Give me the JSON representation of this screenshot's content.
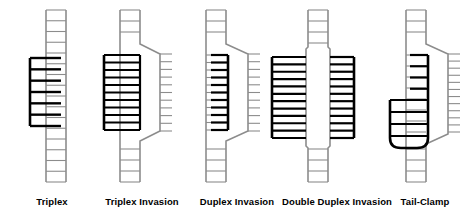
{
  "figure": {
    "title": "",
    "background_color": "#ffffff",
    "duplex_color": "#8c8c8c",
    "invader_color": "#000000",
    "width": 463,
    "height": 217
  },
  "panels": [
    {
      "id": "triplex",
      "label": "Triplex",
      "label_x": 52,
      "center_x": 52,
      "description": "A third strand binds in the major groove of an intact duplex",
      "duplex": {
        "x": 46,
        "top": 10,
        "bottom": 182,
        "width": 20,
        "rungs": 16
      },
      "invader": {
        "type": "single-strand",
        "side": "left",
        "x": 30,
        "top": 58,
        "bottom": 126,
        "rungs": 7
      }
    },
    {
      "id": "triplex-invasion",
      "label": "Triplex Invasion",
      "label_x": 142,
      "center_x": 137,
      "description": "Two strands form a triplex with one duplex strand while the other strand is displaced",
      "duplex": {
        "x": 120,
        "top": 10,
        "bottom": 182,
        "width": 20,
        "rungs": 16
      },
      "invader": {
        "type": "bis-strand",
        "side": "left",
        "x": 104,
        "top": 55,
        "bottom": 130,
        "rungs": 10
      },
      "displaced": {
        "side": "right",
        "bulge_x": 160,
        "top": 48,
        "bottom": 137,
        "ticks": 10
      }
    },
    {
      "id": "duplex-invasion",
      "label": "Duplex Invasion",
      "label_x": 237,
      "center_x": 225,
      "description": "A single invading strand pairs with one duplex strand, displacing the other",
      "duplex": {
        "x": 206,
        "top": 10,
        "bottom": 182,
        "width": 20,
        "rungs": 16
      },
      "invader": {
        "type": "single-strand",
        "side": "right-inner",
        "x": 228,
        "top": 55,
        "bottom": 130,
        "rungs": 10
      },
      "displaced": {
        "side": "right",
        "bulge_x": 248,
        "top": 48,
        "bottom": 137,
        "ticks": 10
      }
    },
    {
      "id": "double-duplex-invasion",
      "label": "Double Duplex Invasion",
      "label_x": 337,
      "center_x": 318,
      "description": "Two invading strands each pair with one of the separated duplex strands",
      "duplex": {
        "x": 308,
        "top": 10,
        "bottom": 182,
        "width": 20,
        "rungs": 16
      },
      "invader_left": {
        "type": "single-strand",
        "side": "left",
        "x": 272,
        "top": 57,
        "bottom": 138,
        "rungs": 11
      },
      "invader_right": {
        "type": "single-strand",
        "side": "right",
        "x": 354,
        "top": 57,
        "bottom": 138,
        "rungs": 11
      }
    },
    {
      "id": "tail-clamp",
      "label": "Tail-Clamp",
      "label_x": 425,
      "center_x": 418,
      "description": "A hairpin clamp with an extended tail arm invades the duplex, displacing one strand",
      "duplex": {
        "x": 406,
        "top": 10,
        "bottom": 182,
        "width": 20,
        "rungs": 16
      },
      "invader": {
        "type": "hairpin-clamp",
        "long_arm_x": 428,
        "short_arm_x": 390,
        "long_top": 55,
        "short_top": 100,
        "loop_bottom": 148,
        "rungs": 9
      },
      "displaced": {
        "side": "right",
        "bulge_x": 448,
        "top": 48,
        "bottom": 142,
        "ticks": 11
      }
    }
  ],
  "legend_note": ""
}
